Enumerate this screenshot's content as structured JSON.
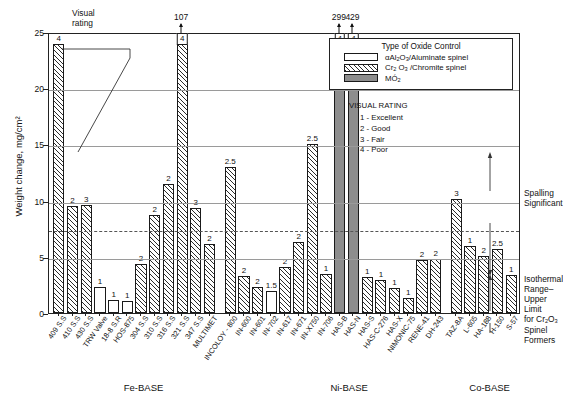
{
  "chart_data": {
    "type": "bar",
    "title": "",
    "xlabel": "",
    "ylabel": "Weight change, mg/cm²",
    "ylim": [
      0,
      25
    ],
    "yticks": [
      0,
      5,
      10,
      15,
      20,
      25
    ],
    "grid": true,
    "threshold_line": 7.5,
    "groups": [
      {
        "name": "Fe-BASE"
      },
      {
        "name": "Ni-BASE"
      },
      {
        "name": "Co-BASE"
      }
    ],
    "categories": [
      "409 S.S",
      "410 S.S",
      "430 S.S",
      "TRW Valve",
      "18-8 S.R",
      "HOS-875",
      "304 S.S",
      "310 S.S",
      "316 S.S",
      "321 S.S",
      "347 S.S",
      "MULTIMET",
      "INCOLOY - 800",
      "IN-600",
      "IN-601",
      "IN-702",
      "IN-617",
      "IN-671",
      "IN-X750",
      "IN-706",
      "HAS-B",
      "HAS-N",
      "HAS-S",
      "HAS-C-276",
      "HAS-X",
      "NIMONIC-75",
      "RENE-41",
      "DH-243",
      "TAZ-8A",
      "L-605",
      "HA-188",
      "H-150",
      "S-57"
    ],
    "values": [
      23.9,
      9.5,
      9.6,
      2.3,
      1.2,
      1.1,
      4.4,
      8.7,
      11.5,
      24.3,
      9.3,
      6.1,
      13.0,
      3.3,
      2.3,
      2.0,
      4.1,
      6.3,
      15.0,
      3.5,
      107.0,
      429.0,
      3.2,
      2.9,
      2.2,
      1.3,
      4.7,
      4.8,
      10.1,
      6.0,
      5.1,
      5.7,
      3.4
    ],
    "visual_ratings": [
      "4",
      "2",
      "3",
      "1",
      "1",
      "1",
      "2",
      "2",
      "2",
      "4",
      "3",
      "2",
      "2.5",
      "2",
      "2",
      "1.5",
      "2",
      "2",
      "2.5",
      "1",
      "4",
      "4",
      "1",
      "1",
      "1",
      "1",
      "2",
      "2",
      "3",
      "1",
      "2",
      "2.5",
      "1"
    ],
    "oxide_types": [
      "chromite",
      "chromite",
      "chromite",
      "alumina",
      "alumina",
      "alumina",
      "chromite",
      "chromite",
      "chromite",
      "chromite",
      "chromite",
      "chromite",
      "chromite",
      "chromite",
      "chromite",
      "alumina",
      "chromite",
      "chromite",
      "chromite",
      "chromite",
      "mo2",
      "mo2",
      "chromite",
      "chromite",
      "chromite",
      "chromite",
      "chromite",
      "chromite",
      "chromite",
      "chromite",
      "chromite",
      "chromite",
      "chromite"
    ],
    "offscale_annotations": [
      {
        "category": "321 S.S",
        "label": "107"
      },
      {
        "category": "HAS-B",
        "label": "299"
      },
      {
        "category": "HAS-N",
        "label": "429"
      }
    ],
    "offscale_bar_labels": {
      "HAS-B": "299",
      "HAS-N": "429",
      "321 S.S": "107"
    }
  },
  "legend": {
    "title": "Type of Oxide Control",
    "items": [
      {
        "swatch": "alumina",
        "label_html": "αAl<sub>2</sub>O<sub>3</sub>/Aluminate spinel"
      },
      {
        "swatch": "chromite",
        "label_html": "Cr<sub>2</sub> O<sub>3</sub> /Chromite spinel"
      },
      {
        "swatch": "mo2",
        "label_html": "MÓ<sub>2</sub>"
      }
    ]
  },
  "visual_rating_key": {
    "title": "VISUAL RATING",
    "items": [
      "1 - Excellent",
      "2 - Good",
      "3 - Fair",
      "4 - Poor"
    ]
  },
  "callout": {
    "label": "Visual\nrating",
    "line1": "Visual",
    "line2": "rating"
  },
  "side_annotations": {
    "upper": {
      "line1": "Spalling",
      "line2": "Significant"
    },
    "lower": {
      "line1": "Isothermal",
      "line2": "Range–",
      "line3": "Upper Limit",
      "line4_html": "for Cr<sub>2</sub>O<sub>3</sub>",
      "line5": "Spinel",
      "line6": "Formers"
    }
  },
  "colors": {
    "axis": "#222222",
    "grid": "#9a9a9a",
    "mo2_fill": "#8d8d8d",
    "hatch": "#2b2b2b",
    "background": "#ffffff"
  }
}
